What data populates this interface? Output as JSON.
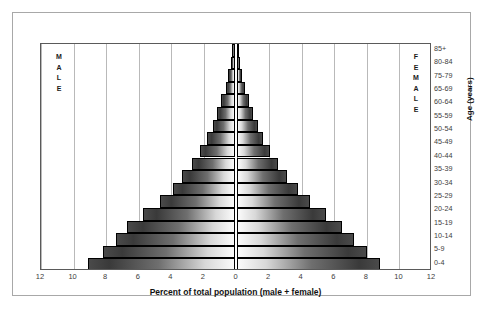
{
  "chart_data": {
    "type": "bar",
    "subtype": "population-pyramid",
    "title": "",
    "xlabel": "Percent of total population (male + female)",
    "ylabel": "Age (years)",
    "xlim": [
      -12,
      12
    ],
    "xticks": [
      12,
      10,
      8,
      6,
      4,
      2,
      0,
      2,
      4,
      6,
      8,
      10,
      12
    ],
    "grid": true,
    "legend_position": "in-plot-corners",
    "left_panel_label": "MALE",
    "right_panel_label": "FEMALE",
    "categories": [
      "0-4",
      "5-9",
      "10-14",
      "15-19",
      "20-24",
      "25-29",
      "30-34",
      "35-39",
      "40-44",
      "45-49",
      "50-54",
      "55-59",
      "60-64",
      "65-69",
      "70-74",
      "75-79",
      "80-84",
      "85+"
    ],
    "visible_category_labels": [
      "85+",
      "80-84",
      "75-79",
      "65-69",
      "60-64",
      "55-59",
      "50-54",
      "45-49",
      "40-44",
      "35-39",
      "30-34",
      "25-29",
      "20-24",
      "15-19",
      "10-14",
      "5-9",
      "0-4"
    ],
    "series": [
      {
        "name": "MALE",
        "side": "left",
        "values": [
          9.0,
          8.1,
          7.3,
          6.6,
          5.6,
          4.6,
          3.8,
          3.2,
          2.6,
          2.1,
          1.7,
          1.35,
          1.05,
          0.8,
          0.55,
          0.38,
          0.22,
          0.1
        ]
      },
      {
        "name": "FEMALE",
        "side": "right",
        "values": [
          8.8,
          8.0,
          7.2,
          6.5,
          5.5,
          4.5,
          3.75,
          3.1,
          2.55,
          2.05,
          1.65,
          1.3,
          1.0,
          0.78,
          0.52,
          0.36,
          0.2,
          0.1
        ]
      }
    ],
    "colors": {
      "bar_outer": "#3a3a3a",
      "bar_inner": "#fbfbfb",
      "bar_outline": "#000000",
      "gridline": "#b9b9b9",
      "center_line": "#8d8d8d",
      "plot_border": "#5a5a5a",
      "frame_border": "#a8a8a8",
      "background": "#ffffff",
      "text": "#3c3c3c"
    }
  }
}
